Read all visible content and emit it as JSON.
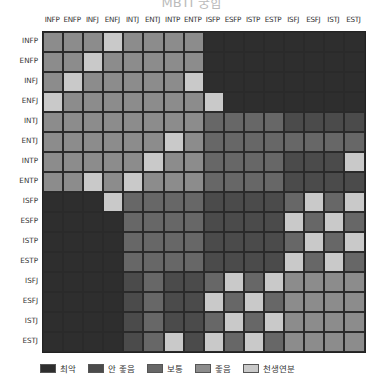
{
  "title": "MBTI 궁합",
  "chart_data": {
    "type": "heatmap",
    "title": "",
    "x_labels": [
      "INFP",
      "ENFP",
      "INFJ",
      "ENFJ",
      "INTJ",
      "ENTJ",
      "INTP",
      "ENTP",
      "ISFP",
      "ESFP",
      "ISTP",
      "ESTP",
      "ISFJ",
      "ESFJ",
      "ISTJ",
      "ESTJ"
    ],
    "y_labels": [
      "INFP",
      "ENFP",
      "INFJ",
      "ENFJ",
      "INTJ",
      "ENTJ",
      "INTP",
      "ENTP",
      "ISFP",
      "ESFP",
      "ISTP",
      "ESTP",
      "ISFJ",
      "ESFJ",
      "ISTJ",
      "ESTJ"
    ],
    "scale": [
      {
        "level": 0,
        "label": "최악",
        "color": "#2e2e2e"
      },
      {
        "level": 1,
        "label": "안 좋음",
        "color": "#4b4b4b"
      },
      {
        "level": 2,
        "label": "보통",
        "color": "#676767"
      },
      {
        "level": 3,
        "label": "좋음",
        "color": "#8c8c8c"
      },
      {
        "level": 4,
        "label": "천생연분",
        "color": "#c9c9c9"
      }
    ],
    "values": [
      [
        3,
        3,
        3,
        4,
        3,
        3,
        3,
        3,
        0,
        0,
        0,
        0,
        0,
        0,
        0,
        0
      ],
      [
        3,
        3,
        4,
        3,
        3,
        3,
        3,
        3,
        0,
        0,
        0,
        0,
        0,
        0,
        0,
        0
      ],
      [
        3,
        4,
        3,
        3,
        3,
        3,
        3,
        4,
        0,
        0,
        0,
        0,
        0,
        0,
        0,
        0
      ],
      [
        4,
        3,
        3,
        3,
        3,
        3,
        3,
        3,
        4,
        0,
        0,
        0,
        0,
        0,
        0,
        0
      ],
      [
        3,
        3,
        3,
        3,
        3,
        3,
        3,
        3,
        2,
        2,
        2,
        2,
        1,
        1,
        1,
        1
      ],
      [
        3,
        3,
        3,
        3,
        3,
        3,
        4,
        3,
        2,
        2,
        2,
        2,
        2,
        2,
        2,
        2
      ],
      [
        3,
        3,
        3,
        3,
        3,
        4,
        3,
        3,
        2,
        2,
        2,
        2,
        1,
        1,
        1,
        4
      ],
      [
        3,
        3,
        4,
        3,
        4,
        3,
        3,
        3,
        2,
        2,
        2,
        2,
        1,
        1,
        1,
        1
      ],
      [
        0,
        0,
        0,
        4,
        2,
        2,
        2,
        2,
        1,
        1,
        1,
        1,
        2,
        4,
        2,
        4
      ],
      [
        0,
        0,
        0,
        0,
        2,
        2,
        2,
        2,
        1,
        1,
        1,
        1,
        4,
        2,
        4,
        2
      ],
      [
        0,
        0,
        0,
        0,
        2,
        2,
        2,
        2,
        1,
        1,
        1,
        1,
        2,
        4,
        2,
        4
      ],
      [
        0,
        0,
        0,
        0,
        2,
        2,
        2,
        2,
        1,
        1,
        1,
        1,
        4,
        2,
        4,
        2
      ],
      [
        0,
        0,
        0,
        0,
        1,
        2,
        1,
        1,
        2,
        4,
        2,
        4,
        3,
        3,
        3,
        3
      ],
      [
        0,
        0,
        0,
        0,
        1,
        2,
        1,
        1,
        4,
        2,
        4,
        2,
        3,
        3,
        3,
        3
      ],
      [
        0,
        0,
        0,
        0,
        1,
        2,
        1,
        1,
        2,
        4,
        2,
        4,
        3,
        3,
        3,
        3
      ],
      [
        0,
        0,
        0,
        0,
        1,
        2,
        4,
        1,
        4,
        2,
        4,
        2,
        3,
        3,
        3,
        3
      ]
    ],
    "legend_position": "bottom"
  },
  "legend": {
    "items": [
      {
        "label": "최악",
        "color": "#2e2e2e"
      },
      {
        "label": "안 좋음",
        "color": "#4b4b4b"
      },
      {
        "label": "보통",
        "color": "#676767"
      },
      {
        "label": "좋음",
        "color": "#8c8c8c"
      },
      {
        "label": "천생연분",
        "color": "#c9c9c9"
      }
    ]
  }
}
